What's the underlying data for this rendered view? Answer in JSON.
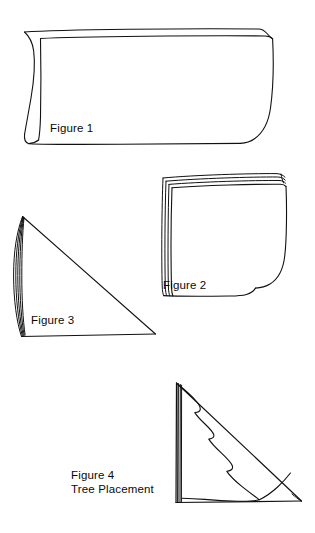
{
  "document": {
    "kind": "instructional-diagram",
    "title": "Paper Folding Tree Placement Diagram",
    "background_color": "#FFFFFF",
    "ink_color": "#111111"
  },
  "figures": [
    {
      "id": "figure-1",
      "label": "Figure 1",
      "caption": "",
      "description": "Sheet of paper folded in half, curled open at left edge"
    },
    {
      "id": "figure-2",
      "label": "Figure 2",
      "caption": "",
      "description": "Paper folded again into a square with accordion folds at left"
    },
    {
      "id": "figure-3",
      "label": "Figure 3",
      "caption": "",
      "description": "Folded paper shown as a triangle with rounded folded spine at left"
    },
    {
      "id": "figure-4",
      "label": "Figure 4",
      "caption": "Tree Placement",
      "description": "Triangle with half-Christmas-tree outline drawn against the folded edge"
    }
  ]
}
